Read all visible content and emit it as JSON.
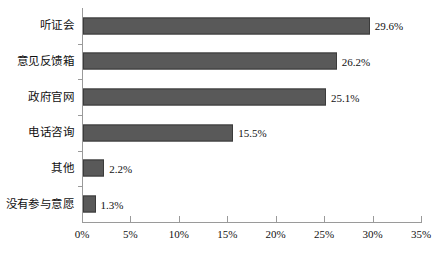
{
  "chart_data": {
    "type": "bar",
    "orientation": "horizontal",
    "title": "",
    "subtitle": "",
    "xlabel": "",
    "ylabel": "",
    "categories": [
      "听证会",
      "意见反馈箱",
      "政府官网",
      "电话咨询",
      "其他",
      "没有参与意愿"
    ],
    "values": [
      29.6,
      26.2,
      25.1,
      15.5,
      2.2,
      1.3
    ],
    "value_labels": [
      "29.6%",
      "26.2%",
      "25.1%",
      "15.5%",
      "2.2%",
      "1.3%"
    ],
    "xlim": [
      0,
      35
    ],
    "xtick_values": [
      0,
      5,
      10,
      15,
      20,
      25,
      30,
      35
    ],
    "xtick_labels": [
      "0%",
      "5%",
      "10%",
      "15%",
      "20%",
      "25%",
      "30%",
      "35%"
    ],
    "grid": false,
    "legend": false,
    "legend_position": "none",
    "series": [
      {
        "name": "",
        "values": [
          29.6,
          26.2,
          25.1,
          15.5,
          2.2,
          1.3
        ]
      }
    ]
  },
  "style": {
    "bar_fill": "#595959",
    "bar_stroke": "#3b3b3b",
    "axis_color": "#9a9a9a",
    "text_color": "#111111",
    "background": "#ffffff"
  }
}
